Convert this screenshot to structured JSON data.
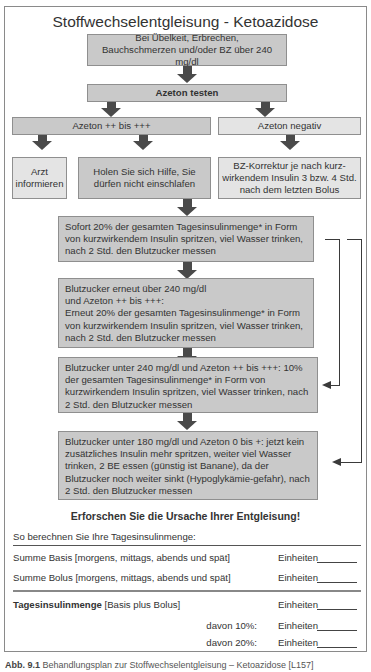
{
  "title": "Stoffwechselentgleisung - Ketoazidose",
  "flow": {
    "start": "Bei Übelkeit, Erbrechen, Bauchschmerzen und/oder BZ über 240 mg/dl",
    "test": "Azeton testen",
    "positive": "Azeton ++ bis +++",
    "negative": "Azeton negativ",
    "doctor": "Arzt informieren",
    "help": "Holen Sie sich Hilfe, Sie dürfen nicht einschlafen",
    "correction": "BZ-Korrektur je nach kurz-wirkendem Insulin 3 bzw. 4 Std. nach dem letzten Bolus",
    "step1": "Sofort 20% der gesamten Tagesinsulinmenge* in Form von kurzwirkendem Insulin spritzen, viel Wasser trinken, nach 2 Std. den Blutzucker messen",
    "step2_line1": "Blutzucker erneut über 240 mg/dl",
    "step2_line2": "und Azeton ++ bis +++:",
    "step2_rest": "Erneut 20% der gesamten Tagesinsulinmenge* in Form von kurzwirkendem Insulin spritzen, viel Wasser trinken, nach 2 Std. den Blutzucker messen",
    "step3": "Blutzucker unter 240 mg/dl und Azeton ++ bis +++: 10% der gesamten Tagesinsulinmenge* in Form von kurzwirkendem Insulin spritzen, viel Wasser trinken, nach 2 Std. den Blutzucker messen",
    "step4": "Blutzucker unter 180 mg/dl und Azeton 0 bis +: jetzt kein zusätzliches Insulin mehr spritzen, weiter viel Wasser trinken, 2 BE essen (günstig ist Banane), da der Blutzucker noch weiter sinkt (Hypoglykämie-gefahr), nach 2 Std. den Blutzucker messen",
    "conclusion": "Erforschen Sie die Ursache Ihrer Entgleisung!"
  },
  "calc": {
    "heading": "So berechnen Sie Ihre Tagesinsulinmenge:",
    "unit": "Einheiten",
    "rows": [
      {
        "label": "Summe Basis [morgens, mittags, abends und spät]"
      },
      {
        "label": "Summe Bolus [morgens, mittags, abends und spät]"
      }
    ],
    "total_bold": "Tagesinsulinmenge",
    "total_rest": " [Basis plus Bolus]",
    "pct10": "davon 10%:",
    "pct20": "davon 20%:"
  },
  "caption": {
    "label": "Abb. 9.1",
    "text": " Behandlungsplan zur Stoffwechselentgleisung – Ketoazidose [L157]"
  }
}
